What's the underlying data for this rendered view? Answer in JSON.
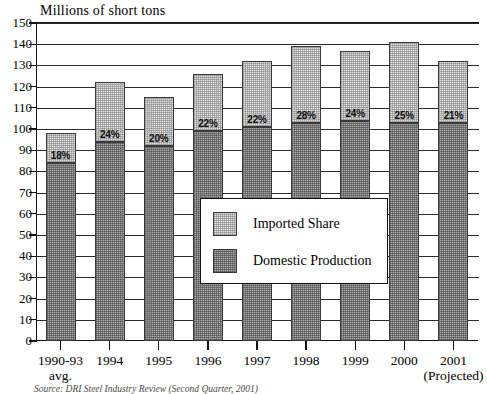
{
  "chart_data": {
    "type": "bar",
    "title": "Millions of short tons",
    "subtitle": "",
    "xlabel": "",
    "ylabel": "Millions of short tons",
    "ylim": [
      0,
      150
    ],
    "ytick_step": 10,
    "yticks": [
      150,
      140,
      130,
      120,
      110,
      100,
      90,
      80,
      70,
      60,
      50,
      40,
      30,
      20,
      10,
      0
    ],
    "grid": true,
    "stacked": true,
    "legend_position": "inside-center",
    "categories": [
      "1990-93 avg.",
      "1994",
      "1995",
      "1996",
      "1997",
      "1998",
      "1999",
      "2000",
      "2001 (Projected)"
    ],
    "series": [
      {
        "name": "Domestic Production",
        "values": [
          84,
          94,
          92,
          99,
          101,
          103,
          104,
          103,
          103
        ]
      },
      {
        "name": "Imported Share",
        "values": [
          14,
          28,
          23,
          27,
          31,
          36,
          33,
          38,
          29
        ]
      }
    ],
    "totals": [
      98,
      122,
      115,
      126,
      132,
      139,
      137,
      141,
      132
    ],
    "data_labels": [
      "18%",
      "24%",
      "20%",
      "22%",
      "22%",
      "28%",
      "24%",
      "25%",
      "21%"
    ],
    "annotations": [
      "Source: DRI Steel Industry Review (Second Quarter, 2001)"
    ],
    "colors": {
      "imported": "#dedede",
      "domestic": "#a8a8a8",
      "axis": "#111111",
      "grid": "#2b2b2b"
    }
  },
  "axis": {
    "x_labels": [
      {
        "line1": "1990-93",
        "line2": "avg."
      },
      {
        "line1": "1994",
        "line2": ""
      },
      {
        "line1": "1995",
        "line2": ""
      },
      {
        "line1": "1996",
        "line2": ""
      },
      {
        "line1": "1997",
        "line2": ""
      },
      {
        "line1": "1998",
        "line2": ""
      },
      {
        "line1": "1999",
        "line2": ""
      },
      {
        "line1": "2000",
        "line2": ""
      },
      {
        "line1": "2001",
        "line2": "(Projected)"
      }
    ]
  },
  "legend": {
    "entries": [
      {
        "label": "Imported Share",
        "swatch": "imported"
      },
      {
        "label": "Domestic Production",
        "swatch": "domestic"
      }
    ]
  },
  "footer": {
    "source": "Source: DRI Steel Industry Review (Second Quarter, 2001)"
  }
}
